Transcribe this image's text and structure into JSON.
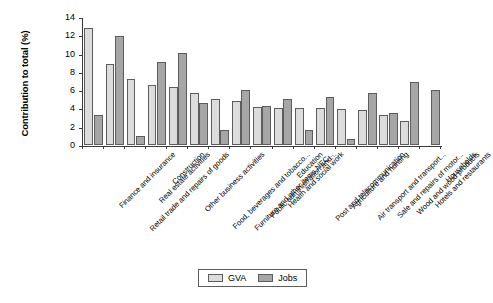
{
  "chart_data": {
    "type": "bar",
    "title": "",
    "xlabel": "",
    "ylabel": "Contribution to total (%)",
    "ylim": [
      0,
      14
    ],
    "ytick_values": [
      0,
      2,
      4,
      6,
      8,
      10,
      12,
      14
    ],
    "ytick_labels": [
      "0",
      "2",
      "4",
      "6",
      "8",
      "10",
      "12",
      "14"
    ],
    "grid": false,
    "legend_position": "bottom-center",
    "categories": [
      "Finance and insurance",
      "Retail trade and repairs of goods",
      "Real estate activities",
      "Construction",
      "Other business activities",
      "Food, beverages and tobacco...",
      "Furniture and other items NEC...",
      "Public administration and...",
      "Health and social work",
      "Education",
      "Post and telecommunication",
      "Agriculture and hunting",
      "Air transport and transport...",
      "Sale and repairs of motor...",
      "Wood and wood products",
      "Hotels and restaurants",
      "Households"
    ],
    "series": [
      {
        "name": "GVA",
        "color": "#dcdcdc",
        "values": [
          12.8,
          8.9,
          7.2,
          6.6,
          6.3,
          5.65,
          5.0,
          4.85,
          4.2,
          4.05,
          4.1,
          4.0,
          3.9,
          3.8,
          3.3,
          2.6,
          null
        ]
      },
      {
        "name": "Jobs",
        "color": "#a6a6a6",
        "values": [
          3.3,
          11.9,
          1.0,
          9.1,
          10.1,
          4.65,
          1.65,
          6.0,
          4.3,
          5.0,
          1.65,
          5.3,
          0.7,
          5.7,
          3.55,
          6.9,
          6.0
        ]
      }
    ]
  },
  "legend": {
    "entries": [
      {
        "label": "GVA"
      },
      {
        "label": "Jobs"
      }
    ]
  }
}
